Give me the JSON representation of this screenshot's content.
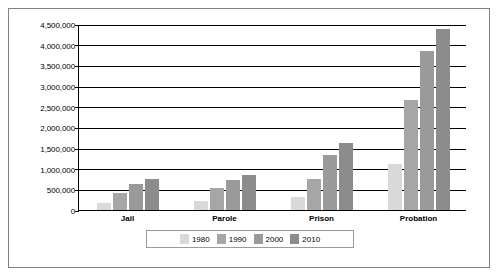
{
  "chart_data": {
    "type": "bar",
    "title": "",
    "xlabel": "",
    "ylabel": "",
    "categories": [
      "Jail",
      "Parole",
      "Prison",
      "Probation"
    ],
    "series": [
      {
        "name": "1980",
        "color": "#d9d9d9",
        "values": [
          180000,
          220000,
          320000,
          1120000
        ]
      },
      {
        "name": "1990",
        "color": "#a6a6a6",
        "values": [
          405000,
          530000,
          740000,
          2670000
        ]
      },
      {
        "name": "2000",
        "color": "#9a9a9a",
        "values": [
          620000,
          725000,
          1330000,
          3840000
        ]
      },
      {
        "name": "2010",
        "color": "#8c8c8c",
        "values": [
          750000,
          840000,
          1610000,
          4390000
        ]
      }
    ],
    "ylim": [
      0,
      4500000
    ],
    "ytick_values": [
      0,
      500000,
      1000000,
      1500000,
      2000000,
      2500000,
      3000000,
      3500000,
      4000000,
      4500000
    ],
    "ytick_labels": [
      "0",
      "500,000",
      "1,000,000",
      "1,500,000",
      "2,000,000",
      "2,500,000",
      "3,000,000",
      "3,500,000",
      "4,000,000",
      "4,500,000"
    ],
    "grid": true,
    "legend_position": "bottom"
  }
}
